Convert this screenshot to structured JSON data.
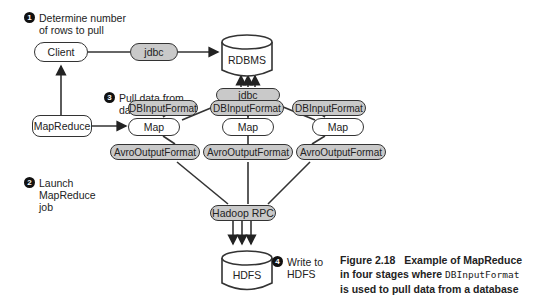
{
  "nodes": {
    "client": "Client",
    "jdbc_top": "jdbc",
    "rdbms": "RDBMS",
    "jdbc_mid": "jdbc",
    "dbinput": [
      "DBInputFormat",
      "DBInputFormat",
      "DBInputFormat"
    ],
    "mapreduce": "MapReduce",
    "map": [
      "Map",
      "Map",
      "Map"
    ],
    "avro": [
      "AvroOutputFormat",
      "AvroOutputFormat",
      "AvroOutputFormat"
    ],
    "hadoop_rpc": "Hadoop RPC",
    "hdfs": "HDFS"
  },
  "steps": [
    {
      "num": "1",
      "line1": "Determine number",
      "line2": "of rows to pull"
    },
    {
      "num": "2",
      "line1": "Launch",
      "line2": "MapReduce",
      "line3": "job"
    },
    {
      "num": "3",
      "line1": "Pull data from",
      "line2": "database"
    },
    {
      "num": "4",
      "line1": "Write to",
      "line2": "HDFS"
    }
  ],
  "caption": {
    "label": "Figure 2.18",
    "text1": "Example of MapReduce",
    "text2a": "in four stages where ",
    "code": "DBInputFormat",
    "text3": "is used to pull data from a database"
  },
  "colors": {
    "pill_grey": "#c9c9c9",
    "stroke": "#333333"
  }
}
